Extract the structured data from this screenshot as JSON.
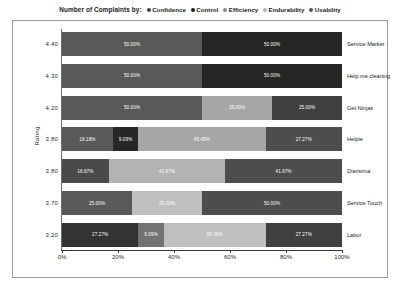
{
  "chart_data": {
    "type": "bar",
    "subtype": "stacked-horizontal-100-percent",
    "title": "Number of Complaints by:",
    "xlabel": "",
    "ylabel": "Rating",
    "xlim": [
      0,
      100
    ],
    "grid": false,
    "legend_position": "top-center",
    "x_ticks": [
      "0%",
      "20%",
      "40%",
      "60%",
      "80%",
      "100%"
    ],
    "x_tick_values": [
      0,
      20,
      40,
      60,
      80,
      100
    ],
    "categories": [
      "4.40",
      "4.30",
      "4.20",
      "3.80",
      "3.80",
      "3.70",
      "3.20"
    ],
    "category_names": [
      "Service Market",
      "Help me cleaning",
      "Get Ninjas",
      "Helpie",
      "Diarisima",
      "Service Touch",
      "Labor"
    ],
    "series": [
      {
        "name": "Confidence",
        "color": "#595959",
        "values": [
          50.0,
          50.0,
          50.0,
          18.18,
          16.67,
          25.0,
          27.27
        ]
      },
      {
        "name": "Control",
        "color": "#262626",
        "values": [
          50.0,
          50.0,
          0,
          9.09,
          0,
          0,
          9.09
        ]
      },
      {
        "name": "Efficiency",
        "color": "#bfbfbf",
        "values": [
          0,
          0,
          25.0,
          45.45,
          41.67,
          25.0,
          36.36
        ]
      },
      {
        "name": "Endurability",
        "color": "#7f7f7f",
        "values": [
          0,
          0,
          0,
          0,
          0,
          0,
          0
        ]
      },
      {
        "name": "Usability",
        "color": "#404040",
        "values": [
          0,
          0,
          25.0,
          27.27,
          41.67,
          50.0,
          27.27
        ]
      }
    ],
    "rows": [
      {
        "rating": "4.40",
        "name": "Service Market",
        "segments": [
          {
            "series": "Confidence",
            "value": 50.0,
            "label": "50.00%",
            "color": "#595959"
          },
          {
            "series": "Control",
            "value": 50.0,
            "label": "50.00%",
            "color": "#262626"
          }
        ]
      },
      {
        "rating": "4.30",
        "name": "Help me cleaning",
        "segments": [
          {
            "series": "Confidence",
            "value": 50.0,
            "label": "50.00%",
            "color": "#595959"
          },
          {
            "series": "Control",
            "value": 50.0,
            "label": "50.00%",
            "color": "#262626"
          }
        ]
      },
      {
        "rating": "4.20",
        "name": "Get Ninjas",
        "segments": [
          {
            "series": "Confidence",
            "value": 50.0,
            "label": "50.00%",
            "color": "#595959"
          },
          {
            "series": "Efficiency",
            "value": 25.0,
            "label": "25.00%",
            "color": "#a6a6a6"
          },
          {
            "series": "Usability",
            "value": 25.0,
            "label": "25.00%",
            "color": "#404040"
          }
        ]
      },
      {
        "rating": "3.80",
        "name": "Helpie",
        "segments": [
          {
            "series": "Confidence",
            "value": 18.18,
            "label": "18.18%",
            "color": "#595959"
          },
          {
            "series": "Control",
            "value": 9.09,
            "label": "9.09%",
            "color": "#262626"
          },
          {
            "series": "Efficiency",
            "value": 45.45,
            "label": "45.45%",
            "color": "#a6a6a6"
          },
          {
            "series": "Usability",
            "value": 27.27,
            "label": "27.27%",
            "color": "#4d4d4d"
          }
        ]
      },
      {
        "rating": "3.80",
        "name": "Diarisima",
        "segments": [
          {
            "series": "Confidence",
            "value": 16.67,
            "label": "16.67%",
            "color": "#4a4a4a"
          },
          {
            "series": "Efficiency",
            "value": 41.67,
            "label": "41.67%",
            "color": "#b3b3b3"
          },
          {
            "series": "Usability",
            "value": 41.67,
            "label": "41.67%",
            "color": "#4d4d4d"
          }
        ]
      },
      {
        "rating": "3.70",
        "name": "Service Touch",
        "segments": [
          {
            "series": "Confidence",
            "value": 25.0,
            "label": "25.00%",
            "color": "#595959"
          },
          {
            "series": "Efficiency",
            "value": 25.0,
            "label": "25.00%",
            "color": "#bfbfbf"
          },
          {
            "series": "Usability",
            "value": 50.0,
            "label": "50.00%",
            "color": "#4d4d4d"
          }
        ]
      },
      {
        "rating": "3.20",
        "name": "Labor",
        "segments": [
          {
            "series": "Confidence",
            "value": 27.27,
            "label": "27.27%",
            "color": "#333333"
          },
          {
            "series": "Control",
            "value": 9.09,
            "label": "9.09%",
            "color": "#737373"
          },
          {
            "series": "Efficiency",
            "value": 36.36,
            "label": "36.36%",
            "color": "#bfbfbf"
          },
          {
            "series": "Usability",
            "value": 27.27,
            "label": "27.27%",
            "color": "#404040"
          }
        ]
      }
    ]
  },
  "legend": {
    "title": "Number of Complaints by:",
    "items": [
      {
        "label": "Confidence",
        "color": "#3f3f3f"
      },
      {
        "label": "Control",
        "color": "#1f1f1f"
      },
      {
        "label": "Efficiency",
        "color": "#8c8c8c"
      },
      {
        "label": "Endurability",
        "color": "#b3b3b3"
      },
      {
        "label": "Usability",
        "color": "#595959"
      }
    ]
  },
  "axes": {
    "y_title": "Rating"
  }
}
